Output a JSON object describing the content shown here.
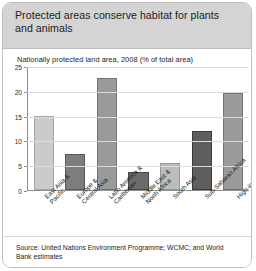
{
  "card": {
    "title": "Protected areas conserve habitat for plants and animals",
    "source": "Source: United Nations Environment Programme; WCMC; and World Bank estimates"
  },
  "chart_data": {
    "type": "bar",
    "title": "Nationally protected land area, 2008 (% of total area)",
    "xlabel": "",
    "ylabel": "",
    "ylim": [
      0,
      25
    ],
    "yticks": [
      "0",
      "5",
      "10",
      "15",
      "20",
      "25"
    ],
    "grid": true,
    "legend": "none",
    "categories": [
      "East Asia & Pacific",
      "Europe & Central Asia",
      "Latin America & Caribbean",
      "Middle East & North Africa",
      "South Asia",
      "Sub-Saharan Africa",
      "High-income"
    ],
    "values": [
      15.0,
      7.3,
      22.8,
      3.7,
      5.5,
      12.0,
      19.8
    ],
    "colors": [
      "#cbcbcb",
      "#7d7d7d",
      "#9a9a9a",
      "#6b6b6b",
      "#bcbcbc",
      "#5e5e5e",
      "#9a9a9a"
    ]
  },
  "palette": {
    "header_bg": "#d4d4d4",
    "card_border": "#bfbfbf",
    "grid": "#dcdcdc",
    "axis": "#8e8e8e"
  }
}
